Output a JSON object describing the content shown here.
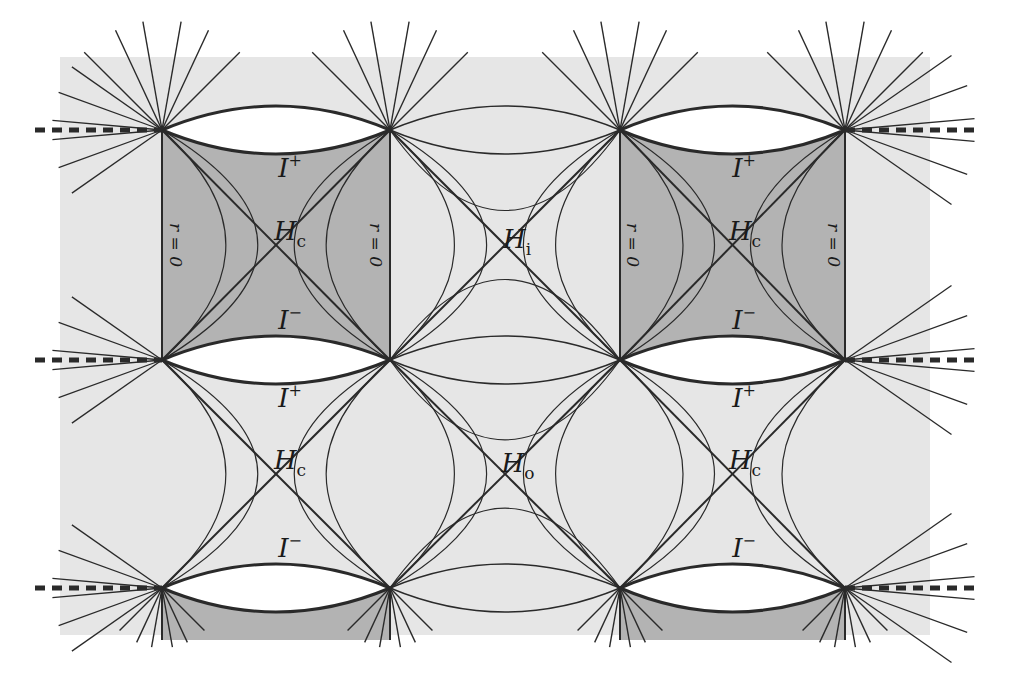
{
  "figure": {
    "type": "Penrose diagram",
    "colors": {
      "background": "#ffffff",
      "light_region": "#e6e6e6",
      "dark_region": "#b3b3b3",
      "lens": "#ffffff",
      "line": "#2a2a2a"
    },
    "labels": {
      "scri_plus": "I",
      "scri_minus": "I",
      "plus_sup": "+",
      "minus_sup": "−",
      "horizon": "H",
      "sub_c": "c",
      "sub_i": "i",
      "sub_o": "o",
      "r_zero": "r = 0"
    },
    "cells": [
      {
        "row": 0,
        "col": 0,
        "shaded": true,
        "top": "I+",
        "center": "Hc",
        "bottom": "I−",
        "r_zero_edges": [
          "left",
          "right"
        ]
      },
      {
        "row": 0,
        "col": 1,
        "shaded": false,
        "center": "Hi"
      },
      {
        "row": 0,
        "col": 2,
        "shaded": true,
        "top": "I+",
        "center": "Hc",
        "bottom": "I−",
        "r_zero_edges": [
          "left",
          "right"
        ]
      },
      {
        "row": 1,
        "col": 0,
        "shaded": false,
        "top": "I+",
        "center": "Hc",
        "bottom": "I−"
      },
      {
        "row": 1,
        "col": 1,
        "shaded": false,
        "center": "Ho"
      },
      {
        "row": 1,
        "col": 2,
        "shaded": false,
        "top": "I+",
        "center": "Hc",
        "bottom": "I−"
      }
    ]
  }
}
